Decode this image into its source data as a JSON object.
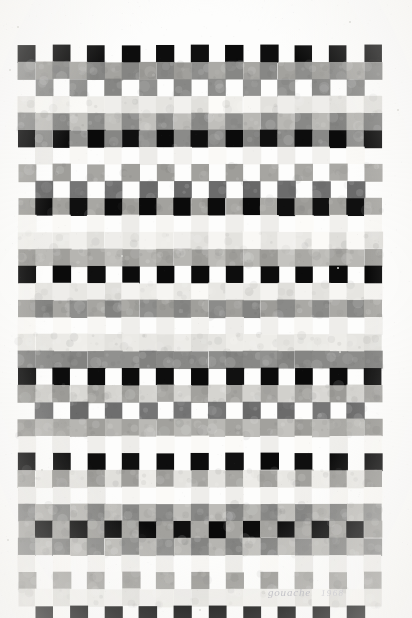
{
  "artwork": {
    "medium_label": "gouache",
    "date_label": "1968",
    "title": "Untitled grid composition",
    "background_color": "#fdfdfc",
    "paper_color": "#fbfaf8"
  },
  "palette": {
    "white": "#ffffff",
    "near_white": "#f6f5f2",
    "pale": "#e9e8e4",
    "light": "#d6d5d1",
    "light_mid": "#bdbcb8",
    "mid": "#9e9d99",
    "mid_dark": "#808080",
    "dark": "#5c5c5c",
    "darker": "#3a3a3a",
    "black": "#0d0d0d"
  },
  "chart_data": {
    "type": "heatmap",
    "xlabel": "",
    "ylabel": "",
    "legend_position": "none",
    "grid": false,
    "cell_width": 17.3,
    "cell_height": 17.0,
    "origin_x": 18,
    "origin_y": 45,
    "columns": 21,
    "rows": 32,
    "value_colors": {
      "0": "#ffffff",
      "1": "#f4f3f0",
      "2": "#e7e6e2",
      "3": "#d4d3cf",
      "4": "#bcbbb7",
      "5": "#a3a29e",
      "6": "#8a8a88",
      "7": "#6e6e6e",
      "8": "#4a4a4a",
      "9": "#0d0d0d"
    },
    "values": [
      [
        9,
        0,
        9,
        0,
        9,
        0,
        9,
        0,
        9,
        0,
        9,
        0,
        9,
        0,
        9,
        0,
        9,
        0,
        9,
        0,
        9
      ],
      [
        6,
        5,
        6,
        5,
        6,
        5,
        6,
        5,
        6,
        5,
        6,
        5,
        6,
        5,
        6,
        5,
        6,
        5,
        6,
        5,
        6
      ],
      [
        0,
        6,
        0,
        6,
        0,
        6,
        0,
        6,
        0,
        6,
        0,
        6,
        0,
        6,
        0,
        6,
        0,
        6,
        0,
        6,
        0
      ],
      [
        2,
        1,
        2,
        1,
        2,
        1,
        2,
        1,
        2,
        1,
        2,
        1,
        2,
        1,
        2,
        1,
        2,
        1,
        2,
        1,
        2
      ],
      [
        6,
        4,
        6,
        4,
        6,
        4,
        6,
        4,
        6,
        4,
        6,
        4,
        6,
        4,
        6,
        4,
        6,
        4,
        6,
        4,
        6
      ],
      [
        9,
        6,
        9,
        6,
        9,
        6,
        9,
        6,
        9,
        6,
        9,
        6,
        9,
        6,
        9,
        6,
        9,
        6,
        9,
        6,
        9
      ],
      [
        0,
        1,
        0,
        1,
        0,
        1,
        0,
        1,
        0,
        1,
        0,
        1,
        0,
        1,
        0,
        1,
        0,
        1,
        0,
        1,
        0
      ],
      [
        5,
        0,
        5,
        0,
        5,
        0,
        5,
        0,
        5,
        0,
        5,
        0,
        5,
        0,
        5,
        0,
        5,
        0,
        5,
        0,
        5
      ],
      [
        0,
        7,
        0,
        7,
        0,
        7,
        0,
        7,
        0,
        7,
        0,
        7,
        0,
        7,
        0,
        7,
        0,
        7,
        0,
        7,
        0
      ],
      [
        5,
        9,
        5,
        9,
        5,
        9,
        5,
        9,
        5,
        9,
        5,
        9,
        5,
        9,
        5,
        9,
        5,
        9,
        5,
        9,
        5
      ],
      [
        1,
        0,
        1,
        0,
        1,
        0,
        1,
        0,
        1,
        0,
        1,
        0,
        1,
        0,
        1,
        0,
        1,
        0,
        1,
        0,
        1
      ],
      [
        2,
        1,
        2,
        1,
        2,
        1,
        2,
        1,
        2,
        1,
        2,
        1,
        2,
        1,
        2,
        1,
        2,
        1,
        2,
        1,
        2
      ],
      [
        5,
        4,
        5,
        4,
        5,
        4,
        5,
        4,
        5,
        4,
        5,
        4,
        5,
        4,
        5,
        4,
        5,
        4,
        5,
        4,
        5
      ],
      [
        9,
        0,
        9,
        0,
        9,
        0,
        9,
        0,
        9,
        0,
        9,
        0,
        9,
        0,
        9,
        0,
        9,
        0,
        9,
        0,
        9
      ],
      [
        1,
        2,
        1,
        2,
        1,
        2,
        1,
        2,
        1,
        2,
        1,
        2,
        1,
        2,
        1,
        2,
        1,
        2,
        1,
        2,
        1
      ],
      [
        5,
        6,
        5,
        6,
        5,
        6,
        5,
        6,
        5,
        6,
        5,
        6,
        5,
        6,
        5,
        6,
        5,
        6,
        5,
        6,
        5
      ],
      [
        1,
        0,
        1,
        0,
        1,
        0,
        1,
        0,
        1,
        0,
        1,
        0,
        1,
        0,
        1,
        0,
        1,
        0,
        1,
        0,
        1
      ],
      [
        2,
        2,
        2,
        2,
        2,
        2,
        2,
        2,
        2,
        2,
        2,
        2,
        2,
        2,
        2,
        2,
        2,
        2,
        2,
        2,
        2
      ],
      [
        6,
        6,
        6,
        6,
        6,
        6,
        6,
        6,
        6,
        6,
        6,
        6,
        6,
        6,
        6,
        6,
        6,
        6,
        6,
        6,
        6
      ],
      [
        9,
        0,
        9,
        0,
        9,
        0,
        9,
        0,
        9,
        0,
        9,
        0,
        9,
        0,
        9,
        0,
        9,
        0,
        9,
        0,
        9
      ],
      [
        5,
        3,
        5,
        3,
        5,
        3,
        5,
        3,
        5,
        3,
        5,
        3,
        5,
        3,
        5,
        3,
        5,
        3,
        5,
        3,
        5
      ],
      [
        0,
        7,
        0,
        7,
        0,
        7,
        0,
        7,
        0,
        7,
        0,
        7,
        0,
        7,
        0,
        7,
        0,
        7,
        0,
        7,
        0
      ],
      [
        5,
        4,
        5,
        4,
        5,
        4,
        5,
        4,
        5,
        4,
        5,
        4,
        5,
        4,
        5,
        4,
        5,
        4,
        5,
        4,
        5
      ],
      [
        1,
        0,
        1,
        0,
        1,
        0,
        1,
        0,
        1,
        0,
        1,
        0,
        1,
        0,
        1,
        0,
        1,
        0,
        1,
        0,
        1
      ],
      [
        9,
        0,
        9,
        0,
        9,
        0,
        9,
        0,
        9,
        0,
        9,
        0,
        9,
        0,
        9,
        0,
        9,
        0,
        9,
        0,
        9
      ],
      [
        5,
        2,
        5,
        2,
        5,
        2,
        5,
        2,
        5,
        2,
        5,
        2,
        5,
        2,
        5,
        2,
        5,
        2,
        5,
        2,
        5
      ],
      [
        1,
        0,
        1,
        0,
        1,
        0,
        1,
        0,
        1,
        0,
        1,
        0,
        1,
        0,
        1,
        0,
        1,
        0,
        1,
        0,
        1
      ],
      [
        6,
        4,
        6,
        4,
        6,
        4,
        6,
        4,
        6,
        4,
        6,
        4,
        6,
        4,
        6,
        4,
        6,
        4,
        6,
        4,
        6
      ],
      [
        5,
        9,
        5,
        9,
        5,
        9,
        5,
        9,
        5,
        9,
        5,
        9,
        5,
        9,
        5,
        9,
        5,
        9,
        5,
        9,
        5
      ],
      [
        6,
        4,
        6,
        4,
        6,
        4,
        6,
        4,
        6,
        4,
        6,
        4,
        6,
        4,
        6,
        4,
        6,
        4,
        6,
        4,
        6
      ],
      [
        1,
        0,
        1,
        0,
        1,
        0,
        1,
        0,
        1,
        0,
        1,
        0,
        1,
        0,
        1,
        0,
        1,
        0,
        1,
        0,
        1
      ],
      [
        5,
        0,
        5,
        0,
        5,
        0,
        5,
        0,
        5,
        0,
        5,
        0,
        5,
        0,
        5,
        0,
        5,
        0,
        5,
        0,
        5
      ],
      [
        2,
        1,
        2,
        1,
        2,
        1,
        2,
        1,
        2,
        1,
        2,
        1,
        2,
        1,
        2,
        1,
        2,
        1,
        2,
        1,
        2
      ],
      [
        0,
        9,
        0,
        9,
        0,
        9,
        0,
        9,
        0,
        9,
        0,
        9,
        0,
        9,
        0,
        9,
        0,
        9,
        0,
        9,
        0
      ]
    ]
  },
  "specks": [
    {
      "x": 18,
      "y": 27,
      "r": 1.2
    },
    {
      "x": 350,
      "y": 22,
      "r": 1.0
    },
    {
      "x": 10,
      "y": 70,
      "r": 1.0
    },
    {
      "x": 398,
      "y": 110,
      "r": 1.0
    },
    {
      "x": 122,
      "y": 256,
      "r": 1.1
    },
    {
      "x": 338,
      "y": 268,
      "r": 1.0
    },
    {
      "x": 42,
      "y": 470,
      "r": 1.0
    },
    {
      "x": 340,
      "y": 352,
      "r": 1.0
    },
    {
      "x": 8,
      "y": 540,
      "r": 1.0
    },
    {
      "x": 200,
      "y": 610,
      "r": 1.0
    }
  ]
}
